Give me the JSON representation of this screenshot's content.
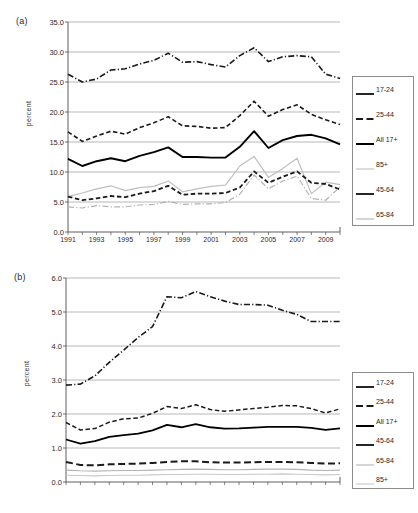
{
  "figure": {
    "panels": [
      {
        "id": "a",
        "label": "(a)",
        "ylabel": "percent"
      },
      {
        "id": "b",
        "label": "(b)",
        "ylabel": "percent"
      }
    ]
  },
  "chart_data": [
    {
      "type": "line",
      "panel": "(a)",
      "title": "",
      "xlabel": "",
      "ylabel": "percent",
      "ylim": [
        0.0,
        35.0
      ],
      "yticks": [
        "0.0",
        "5.0",
        "10.0",
        "15.0",
        "20.0",
        "25.0",
        "30.0",
        "35.0"
      ],
      "ytick_values": [
        0.0,
        5.0,
        10.0,
        15.0,
        20.0,
        25.0,
        30.0,
        35.0
      ],
      "grid": "horizontal",
      "legend_position": "right",
      "x": [
        1991,
        1992,
        1993,
        1994,
        1995,
        1996,
        1997,
        1998,
        1999,
        2000,
        2001,
        2002,
        2003,
        2004,
        2005,
        2006,
        2007,
        2008,
        2009,
        2010
      ],
      "xticks": [
        "1991",
        "1993",
        "1995",
        "1997",
        "1999",
        "2001",
        "2003",
        "2005",
        "2007",
        "2009"
      ],
      "xtick_values": [
        1991,
        1993,
        1995,
        1997,
        1999,
        2001,
        2003,
        2005,
        2007,
        2009
      ],
      "series": [
        {
          "name": "17-24",
          "style": "dash-dot",
          "color": "#1a1a1a",
          "width": 1.6,
          "values": [
            26.3,
            25.0,
            25.5,
            27.0,
            27.2,
            28.0,
            28.6,
            29.8,
            28.3,
            28.4,
            27.9,
            27.5,
            29.4,
            30.7,
            28.4,
            29.2,
            29.4,
            29.2,
            26.3,
            25.6
          ]
        },
        {
          "name": "25-44",
          "style": "dashed",
          "color": "#1a1a1a",
          "width": 1.6,
          "values": [
            16.7,
            15.1,
            16.0,
            16.8,
            16.3,
            17.4,
            18.2,
            19.2,
            17.7,
            17.6,
            17.3,
            17.4,
            19.4,
            21.8,
            19.3,
            20.4,
            21.2,
            19.6,
            18.7,
            17.9
          ]
        },
        {
          "name": "All 17+",
          "style": "solid",
          "color": "#000000",
          "width": 1.9,
          "values": [
            12.2,
            11.0,
            11.8,
            12.3,
            11.8,
            12.7,
            13.3,
            14.1,
            12.5,
            12.5,
            12.4,
            12.4,
            14.2,
            16.8,
            14.0,
            15.3,
            16.0,
            16.2,
            15.6,
            14.6
          ]
        },
        {
          "name": "85+",
          "style": "solid",
          "color": "#bfbfbf",
          "width": 1.2,
          "values": [
            5.9,
            6.5,
            7.2,
            7.7,
            6.9,
            7.4,
            7.6,
            8.5,
            6.7,
            7.2,
            7.6,
            7.8,
            11.0,
            12.6,
            9.1,
            10.6,
            12.3,
            6.4,
            8.3,
            7.9
          ]
        },
        {
          "name": "45-64",
          "style": "dashed",
          "color": "#1a1a1a",
          "width": 1.8,
          "values": [
            5.9,
            5.3,
            5.6,
            6.0,
            5.8,
            6.4,
            6.8,
            7.7,
            6.2,
            6.4,
            6.4,
            6.5,
            7.4,
            10.1,
            8.2,
            9.2,
            10.1,
            8.2,
            8.0,
            7.1
          ]
        },
        {
          "name": "65-84",
          "style": "dash-dot",
          "color": "#b3b3b3",
          "width": 1.2,
          "values": [
            4.2,
            4.0,
            4.4,
            4.2,
            4.2,
            4.5,
            4.6,
            5.1,
            4.6,
            4.7,
            4.7,
            4.9,
            6.3,
            9.5,
            7.2,
            8.5,
            9.3,
            5.6,
            5.3,
            7.5
          ]
        }
      ]
    },
    {
      "type": "line",
      "panel": "(b)",
      "title": "",
      "xlabel": "",
      "ylabel": "percent",
      "ylim": [
        0.0,
        6.0
      ],
      "yticks": [
        "0.0",
        "1.0",
        "2.0",
        "3.0",
        "4.0",
        "5.0",
        "6.0"
      ],
      "ytick_values": [
        0.0,
        1.0,
        2.0,
        3.0,
        4.0,
        5.0,
        6.0
      ],
      "grid": "horizontal",
      "legend_position": "right",
      "x": [
        1991,
        1992,
        1993,
        1994,
        1995,
        1996,
        1997,
        1998,
        1999,
        2000,
        2001,
        2002,
        2003,
        2004,
        2005,
        2006,
        2007,
        2008,
        2009,
        2010
      ],
      "xticks": [
        "1991",
        "1993",
        "1995",
        "1997",
        "1999",
        "2001",
        "2003",
        "2005",
        "2007",
        "2009"
      ],
      "xtick_values": [
        1991,
        1993,
        1995,
        1997,
        1999,
        2001,
        2003,
        2005,
        2007,
        2009
      ],
      "series": [
        {
          "name": "17-24",
          "style": "dashed",
          "color": "#1a1a1a",
          "width": 1.5,
          "values": [
            1.75,
            1.53,
            1.57,
            1.76,
            1.86,
            1.88,
            2.02,
            2.22,
            2.16,
            2.27,
            2.13,
            2.08,
            2.12,
            2.16,
            2.2,
            2.25,
            2.24,
            2.16,
            2.03,
            2.15
          ]
        },
        {
          "name": "25-44",
          "style": "dash-dot",
          "color": "#1a1a1a",
          "width": 1.6,
          "values": [
            2.85,
            2.88,
            3.12,
            3.52,
            3.88,
            4.25,
            4.57,
            5.45,
            5.42,
            5.6,
            5.45,
            5.32,
            5.22,
            5.22,
            5.2,
            5.05,
            4.93,
            4.72,
            4.72,
            4.72
          ]
        },
        {
          "name": "All 17+",
          "style": "solid",
          "color": "#000000",
          "width": 1.8,
          "values": [
            1.25,
            1.13,
            1.2,
            1.33,
            1.38,
            1.42,
            1.52,
            1.68,
            1.61,
            1.7,
            1.61,
            1.57,
            1.58,
            1.6,
            1.62,
            1.62,
            1.62,
            1.59,
            1.53,
            1.58
          ]
        },
        {
          "name": "45-64",
          "style": "dashed",
          "color": "#1a1a1a",
          "width": 2.0,
          "values": [
            0.59,
            0.5,
            0.49,
            0.52,
            0.53,
            0.54,
            0.56,
            0.59,
            0.61,
            0.61,
            0.58,
            0.57,
            0.57,
            0.58,
            0.59,
            0.59,
            0.58,
            0.56,
            0.54,
            0.55
          ]
        },
        {
          "name": "65-84",
          "style": "solid",
          "color": "#b3b3b3",
          "width": 1.1,
          "values": [
            0.35,
            0.33,
            0.32,
            0.33,
            0.34,
            0.34,
            0.35,
            0.36,
            0.37,
            0.38,
            0.37,
            0.36,
            0.36,
            0.37,
            0.38,
            0.38,
            0.37,
            0.35,
            0.34,
            0.35
          ]
        },
        {
          "name": "85+",
          "style": "solid",
          "color": "#c9c9c9",
          "width": 1.1,
          "values": [
            0.2,
            0.19,
            0.18,
            0.19,
            0.2,
            0.2,
            0.21,
            0.22,
            0.22,
            0.23,
            0.23,
            0.22,
            0.22,
            0.23,
            0.23,
            0.24,
            0.23,
            0.22,
            0.21,
            0.22
          ]
        }
      ]
    }
  ],
  "legends": [
    {
      "panel": "(a)",
      "entries": [
        {
          "label": "17-24",
          "style": "solid",
          "color": "#1a1a1a"
        },
        {
          "label": "25-44",
          "style": "dashed",
          "color": "#1a1a1a"
        },
        {
          "label": "All 17+",
          "style": "solid",
          "color": "#000000"
        },
        {
          "label": "85+",
          "style": "solid",
          "color": "#bfbfbf"
        },
        {
          "label": "45-64",
          "style": "solid",
          "color": "#1a1a1a"
        },
        {
          "label": "65-84",
          "style": "solid",
          "color": "#b3b3b3"
        }
      ]
    },
    {
      "panel": "(b)",
      "entries": [
        {
          "label": "17-24",
          "style": "solid",
          "color": "#1a1a1a"
        },
        {
          "label": "25-44",
          "style": "dashed",
          "color": "#1a1a1a"
        },
        {
          "label": "All 17+",
          "style": "solid",
          "color": "#000000"
        },
        {
          "label": "45-64",
          "style": "solid",
          "color": "#1a1a1a"
        },
        {
          "label": "65-84",
          "style": "solid",
          "color": "#b3b3b3"
        },
        {
          "label": "85+",
          "style": "solid",
          "color": "#c9c9c9"
        }
      ]
    }
  ]
}
